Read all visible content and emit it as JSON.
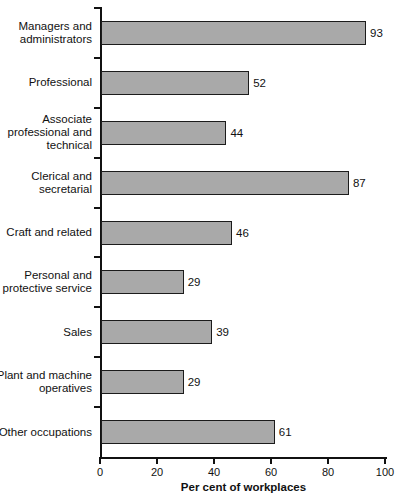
{
  "chart_data": {
    "type": "bar",
    "orientation": "horizontal",
    "title": "",
    "xlabel": "Per cent of workplaces",
    "ylabel": "",
    "xlim": [
      0,
      100
    ],
    "xticks": [
      0,
      20,
      40,
      60,
      80,
      100
    ],
    "grid": false,
    "legend": null,
    "bar_color": "#a9a9a9",
    "bar_edge_color": "#1b1b1b",
    "axis_color": "#111111",
    "value_labels_shown": true,
    "categories": [
      "Managers and\nadministrators",
      "Professional",
      "Associate\nprofessional and\ntechnical",
      "Clerical and\nsecretarial",
      "Craft and related",
      "Personal and\nprotective service",
      "Sales",
      "Plant and machine\noperatives",
      "Other occupations"
    ],
    "values": [
      93,
      52,
      44,
      87,
      46,
      29,
      39,
      29,
      61
    ],
    "value_labels": [
      "93",
      "52",
      "44",
      "87",
      "46",
      "29",
      "39",
      "29",
      "61"
    ],
    "xtick_labels": [
      "0",
      "20",
      "40",
      "60",
      "80",
      "100"
    ]
  }
}
